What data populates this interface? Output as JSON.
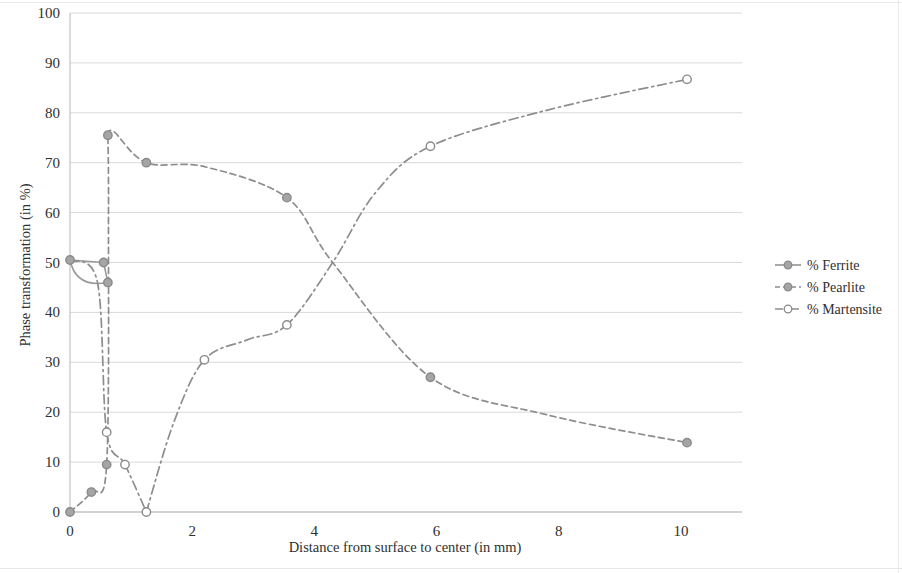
{
  "chart_data": {
    "type": "line",
    "title": "",
    "xlabel": "Distance from surface to center (in mm)",
    "ylabel": "Phase transformation (in %)",
    "xlim": [
      0,
      11
    ],
    "ylim": [
      0,
      100
    ],
    "xticks": [
      "0",
      "2",
      "4",
      "6",
      "8",
      "10"
    ],
    "xtick_values": [
      0,
      2,
      4,
      6,
      8,
      10
    ],
    "yticks": [
      "0",
      "10",
      "20",
      "30",
      "40",
      "50",
      "60",
      "70",
      "80",
      "90",
      "100"
    ],
    "ytick_values": [
      0,
      10,
      20,
      30,
      40,
      50,
      60,
      70,
      80,
      90,
      100
    ],
    "grid": true,
    "legend_position": "right",
    "series": [
      {
        "name": "% Ferrite",
        "color": "#9a9a9a",
        "dash": "none",
        "marker": "circle-filled",
        "x": [
          0.0,
          0.55,
          0.62
        ],
        "y": [
          50.5,
          50.0,
          46.0
        ]
      },
      {
        "name": "% Pearlite",
        "color": "#8d8d8d",
        "dash": "dashed",
        "marker": "circle-filled",
        "x": [
          0.0,
          0.35,
          0.6,
          0.62,
          0.75,
          1.25,
          2.2,
          3.55,
          4.3,
          5.9,
          7.8,
          10.1
        ],
        "y": [
          0.0,
          4.0,
          9.5,
          75.5,
          76.2,
          70.0,
          69.2,
          63.0,
          50.0,
          27.0,
          19.5,
          13.9
        ]
      },
      {
        "name": "% Martensite",
        "color": "#8d8d8d",
        "dash": "dashdot",
        "marker": "circle-open",
        "x": [
          0.0,
          0.6,
          0.62,
          0.9,
          1.25,
          2.2,
          3.55,
          4.3,
          5.9,
          7.8,
          10.1
        ],
        "y": [
          50.5,
          46.0,
          100.0,
          9.5,
          0.0,
          30.5,
          37.5,
          50.0,
          73.3,
          80.5,
          86.7
        ]
      }
    ],
    "points": {
      "ferrite": [
        [
          0.0,
          50.5
        ],
        [
          0.55,
          50.0
        ],
        [
          0.62,
          46.0
        ]
      ],
      "pearlite": [
        [
          0.0,
          0.0
        ],
        [
          0.35,
          4.0
        ],
        [
          0.6,
          9.5
        ],
        [
          0.62,
          75.5
        ],
        [
          1.25,
          70.0
        ],
        [
          3.55,
          63.0
        ],
        [
          5.9,
          27.0
        ],
        [
          10.1,
          13.9
        ]
      ],
      "martensite": [
        [
          0.0,
          50.5
        ],
        [
          0.55,
          50.0
        ],
        [
          0.62,
          46.0
        ],
        [
          0.6,
          16.0
        ],
        [
          0.9,
          9.5
        ],
        [
          1.25,
          0.0
        ],
        [
          2.2,
          30.5
        ],
        [
          3.55,
          37.5
        ],
        [
          5.9,
          73.3
        ],
        [
          10.1,
          86.7
        ]
      ]
    },
    "legend": [
      {
        "label": "% Ferrite",
        "marker": "circle-filled",
        "dash": "solid"
      },
      {
        "label": "% Pearlite",
        "marker": "circle-filled",
        "dash": "dashed"
      },
      {
        "label": "% Martensite",
        "marker": "circle-open",
        "dash": "dashdot"
      }
    ]
  }
}
